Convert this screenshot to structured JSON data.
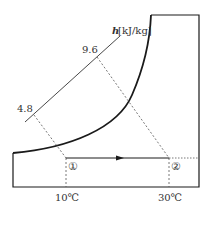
{
  "diagram": {
    "type": "psychrometric-chart",
    "enthalpy_axis": {
      "symbol": "h",
      "unit": "[kJ/kg]",
      "ticks": [
        "4.8",
        "9.6"
      ]
    },
    "temperature_axis": {
      "ticks": [
        "10℃",
        "30℃"
      ]
    },
    "states": [
      {
        "id": "1",
        "label": "①",
        "temperature": "10℃",
        "enthalpy": "4.8"
      },
      {
        "id": "2",
        "label": "②",
        "temperature": "30℃",
        "enthalpy": "9.6"
      }
    ],
    "process": {
      "from": "①",
      "to": "②",
      "description": "sensible heating (constant humidity ratio)"
    },
    "colors": {
      "line": "#1a1a1a",
      "dashed": "#555555",
      "text": "#333333"
    }
  }
}
